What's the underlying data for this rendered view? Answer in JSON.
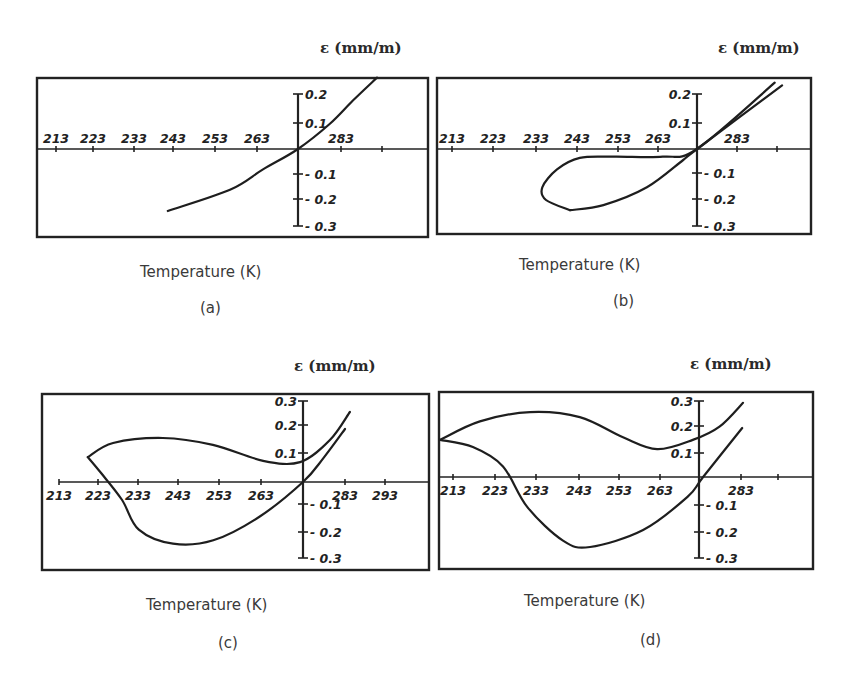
{
  "figure": {
    "panels": [
      {
        "id": "a",
        "tag": "(a)",
        "ylabel": "ε (mm/m)",
        "xlabel": "Temperature (K)"
      },
      {
        "id": "b",
        "tag": "(b)",
        "ylabel": "ε (mm/m)",
        "xlabel": "Temperature (K)"
      },
      {
        "id": "c",
        "tag": "(c)",
        "ylabel": "ε (mm/m)",
        "xlabel": "Temperature (K)"
      },
      {
        "id": "d",
        "tag": "(d)",
        "ylabel": "ε (mm/m)",
        "xlabel": "Temperature (K)"
      }
    ]
  },
  "chart_data": [
    {
      "panel": "(a)",
      "type": "line",
      "title": "",
      "xlabel": "Temperature (K)",
      "ylabel": "ε (mm/m)",
      "x_tick_labels": [
        "213",
        "223",
        "233",
        "243",
        "253",
        "263",
        "283"
      ],
      "y_tick_labels": [
        "0.2",
        "0.1",
        "-0.1",
        "-0.2",
        "-0.3"
      ],
      "xlim": [
        208,
        297
      ],
      "ylim": [
        -0.35,
        0.28
      ],
      "grid": false,
      "series": [
        {
          "name": "strain",
          "x": [
            241,
            256.3,
            264.4,
            273,
            280.9,
            286.5,
            292.4
          ],
          "y": [
            -0.243,
            -0.16,
            -0.08,
            0,
            0.1,
            0.19,
            0.28
          ]
        }
      ]
    },
    {
      "panel": "(b)",
      "type": "line",
      "title": "",
      "xlabel": "Temperature (K)",
      "ylabel": "ε (mm/m)",
      "x_tick_labels": [
        "213",
        "223",
        "233",
        "243",
        "253",
        "263",
        "283"
      ],
      "y_tick_labels": [
        "0.2",
        "0.1",
        "-0.1",
        "-0.2",
        "-0.3"
      ],
      "xlim": [
        208,
        297
      ],
      "ylim": [
        -0.34,
        0.28
      ],
      "grid": false,
      "series": [
        {
          "name": "cooling",
          "x": [
            292.1,
            273,
            264.6,
            252.4,
            244.2,
            238.6,
            235,
            235.9,
            241.8
          ],
          "y": [
            0.26,
            0,
            -0.03,
            -0.03,
            -0.035,
            -0.08,
            -0.15,
            -0.2,
            -0.24
          ]
        },
        {
          "name": "heating",
          "x": [
            241.8,
            250,
            260.7,
            269.6,
            273,
            293.9
          ],
          "y": [
            -0.24,
            -0.22,
            -0.15,
            -0.043,
            0,
            0.25
          ]
        }
      ]
    },
    {
      "panel": "(c)",
      "type": "line",
      "title": "",
      "xlabel": "Temperature (K)",
      "ylabel": "ε (mm/m)",
      "x_tick_labels": [
        "213",
        "223",
        "233",
        "243",
        "253",
        "263",
        "283",
        "293"
      ],
      "y_tick_labels": [
        "0.3",
        "0.2",
        "0.1",
        "-0.1",
        "-0.2",
        "-0.3"
      ],
      "xlim": [
        208,
        304
      ],
      "ylim": [
        -0.33,
        0.33
      ],
      "grid": false,
      "series": [
        {
          "name": "upper branch",
          "x": [
            220.2,
            226.4,
            238.6,
            250.9,
            263.2,
            272.3,
            279.6,
            284.5
          ],
          "y": [
            0.094,
            0.147,
            0.166,
            0.14,
            0.08,
            0.075,
            0.158,
            0.264
          ]
        },
        {
          "name": "lower branch",
          "x": [
            220.2,
            223.5,
            228.6,
            232.7,
            241.1,
            251,
            262.4,
            273,
            278,
            283.3
          ],
          "y": [
            0.094,
            0.033,
            -0.068,
            -0.18,
            -0.233,
            -0.22,
            -0.13,
            0,
            0.09,
            0.2
          ]
        }
      ]
    },
    {
      "panel": "(d)",
      "type": "line",
      "title": "",
      "xlabel": "Temperature (K)",
      "ylabel": "ε (mm/m)",
      "x_tick_labels": [
        "213",
        "223",
        "233",
        "243",
        "253",
        "263",
        "283"
      ],
      "y_tick_labels": [
        "0.3",
        "0.2",
        "0.1",
        "-0.1",
        "-0.2",
        "-0.3"
      ],
      "xlim": [
        210,
        300
      ],
      "ylim": [
        -0.35,
        0.33
      ],
      "grid": false,
      "series": [
        {
          "name": "upper branch",
          "x": [
            210,
            219.7,
            231.9,
            244,
            254.5,
            262.8,
            271.5,
            278,
            283.7
          ],
          "y": [
            0.14,
            0.21,
            0.245,
            0.226,
            0.15,
            0.105,
            0.14,
            0.19,
            0.28
          ]
        },
        {
          "name": "lower branch",
          "x": [
            210,
            218,
            225.3,
            231.2,
            239.9,
            246.5,
            259.4,
            270.2,
            274,
            283.5
          ],
          "y": [
            0.14,
            0.113,
            0.04,
            -0.113,
            -0.24,
            -0.264,
            -0.2,
            -0.075,
            0,
            0.185
          ]
        }
      ]
    }
  ]
}
